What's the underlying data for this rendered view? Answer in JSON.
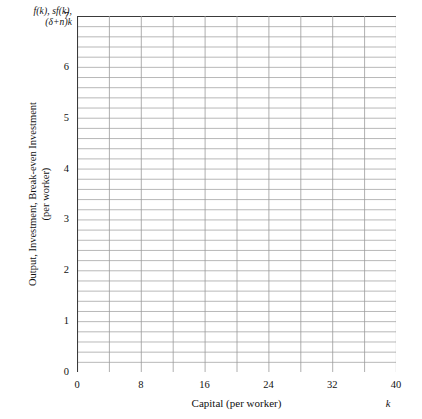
{
  "figure": {
    "corner_label_line1": "f(k), sf(k),",
    "corner_label_line2": "(δ+n)k",
    "y_axis_title_line1": "Output, Investment, Break-even Investment",
    "y_axis_title_line2": "(per worker)",
    "x_axis_title": "Capital (per worker)",
    "x_axis_variable": "k"
  },
  "chart_data": {
    "type": "line",
    "title": "",
    "subtitle": "",
    "xlabel": "Capital (per worker)",
    "ylabel": "Output, Investment, Break-even Investment (per worker)",
    "x_axis_variable": "k",
    "y_axis_variable": "f(k), sf(k), (δ+n)k",
    "xlim": [
      0,
      40
    ],
    "ylim": [
      0,
      7
    ],
    "x_tick_labels": [
      "0",
      "8",
      "16",
      "24",
      "32",
      "40"
    ],
    "x_tick_values": [
      0,
      8,
      16,
      24,
      32,
      40
    ],
    "y_tick_labels": [
      "0",
      "1",
      "2",
      "3",
      "4",
      "5",
      "6",
      "7"
    ],
    "y_tick_values": [
      0,
      1,
      2,
      3,
      4,
      5,
      6,
      7
    ],
    "x_gridline_step": 4,
    "y_gridline_step": 0.2,
    "grid": true,
    "legend": "none",
    "series": [],
    "values": [],
    "categories": [],
    "grid_color": "#9a9a9a",
    "axis_color": "#3a3a3a",
    "background_color": "#ffffff"
  }
}
